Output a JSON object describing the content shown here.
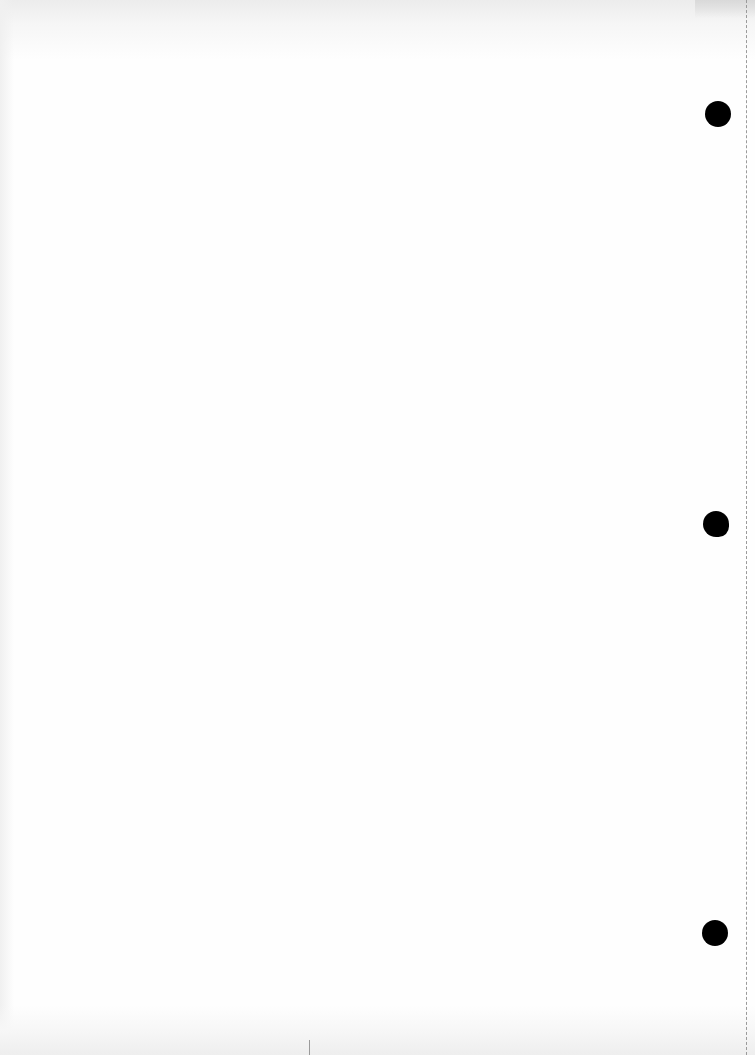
{
  "document": {
    "type": "blank scanned page",
    "text": "",
    "features": {
      "punch_holes": 3,
      "dashed_edge_line": true
    },
    "colors": {
      "paper": "#fefefe",
      "hole": "#000000",
      "dashed_line": "#9a9a9a"
    }
  }
}
